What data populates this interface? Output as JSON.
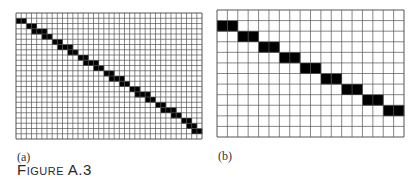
{
  "panels": [
    {
      "id": "a",
      "label": "(a)",
      "cols": 36,
      "rows": 24,
      "filled": [
        [
          1,
          0
        ],
        [
          1,
          1
        ],
        [
          2,
          2
        ],
        [
          2,
          3
        ],
        [
          3,
          3
        ],
        [
          3,
          4
        ],
        [
          3,
          5
        ],
        [
          4,
          5
        ],
        [
          4,
          6
        ],
        [
          5,
          7
        ],
        [
          5,
          8
        ],
        [
          6,
          8
        ],
        [
          6,
          9
        ],
        [
          6,
          10
        ],
        [
          7,
          10
        ],
        [
          7,
          11
        ],
        [
          8,
          12
        ],
        [
          8,
          13
        ],
        [
          9,
          13
        ],
        [
          9,
          14
        ],
        [
          9,
          15
        ],
        [
          10,
          15
        ],
        [
          10,
          16
        ],
        [
          11,
          17
        ],
        [
          11,
          18
        ],
        [
          12,
          18
        ],
        [
          12,
          19
        ],
        [
          12,
          20
        ],
        [
          13,
          20
        ],
        [
          13,
          21
        ],
        [
          14,
          22
        ],
        [
          14,
          23
        ],
        [
          15,
          23
        ],
        [
          15,
          24
        ],
        [
          15,
          25
        ],
        [
          16,
          25
        ],
        [
          16,
          26
        ],
        [
          17,
          27
        ],
        [
          17,
          28
        ],
        [
          18,
          28
        ],
        [
          18,
          29
        ],
        [
          18,
          30
        ],
        [
          19,
          30
        ],
        [
          19,
          31
        ],
        [
          20,
          32
        ],
        [
          20,
          33
        ],
        [
          21,
          33
        ],
        [
          21,
          34
        ],
        [
          22,
          34
        ],
        [
          22,
          35
        ]
      ]
    },
    {
      "id": "b",
      "label": "(b)",
      "cols": 18,
      "rows": 12,
      "filled": [
        [
          1,
          0
        ],
        [
          1,
          1
        ],
        [
          2,
          2
        ],
        [
          2,
          3
        ],
        [
          3,
          4
        ],
        [
          3,
          5
        ],
        [
          4,
          6
        ],
        [
          4,
          7
        ],
        [
          5,
          8
        ],
        [
          5,
          9
        ],
        [
          6,
          10
        ],
        [
          6,
          11
        ],
        [
          7,
          12
        ],
        [
          7,
          13
        ],
        [
          8,
          14
        ],
        [
          8,
          15
        ],
        [
          9,
          16
        ],
        [
          9,
          17
        ]
      ]
    }
  ],
  "caption": "Figure A.3",
  "colors": {
    "grid": "#555555",
    "fill": "#000000"
  }
}
